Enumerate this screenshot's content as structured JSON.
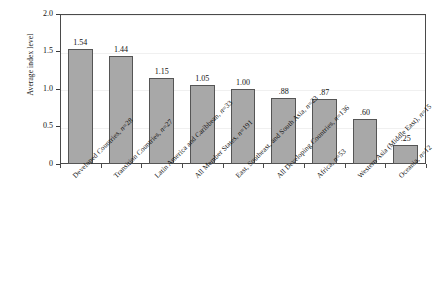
{
  "chart_data": {
    "type": "bar",
    "title": "",
    "xlabel": "",
    "ylabel": "Average index level",
    "ylim": [
      0,
      2.0
    ],
    "yticks": [
      "0",
      "0.5",
      "1.0",
      "1.5",
      "2.0"
    ],
    "ytick_values": [
      0,
      0.5,
      1.0,
      1.5,
      2.0
    ],
    "grid": true,
    "legend": "none",
    "categories": [
      "Developed Countries, n=28",
      "Transition Countries, n=27",
      "Latin America and Caribbean, n=33",
      "All Member States, n=191",
      "East, Southeast, and South Asia, n=23",
      "All Developing Countries, n=136",
      "Africa, n=53",
      "Western Asia (Middle East), n=15",
      "Oceania, n=12"
    ],
    "category_names": [
      "Developed Countries",
      "Transition Countries",
      "Latin America and Caribbean",
      "All Member States",
      "East, Southeast, and South Asia",
      "All Developing Countries",
      "Africa",
      "Western Asia (Middle East)",
      "Oceania"
    ],
    "sample_sizes": [
      28,
      27,
      33,
      191,
      23,
      136,
      53,
      15,
      12
    ],
    "values": [
      1.54,
      1.44,
      1.15,
      1.05,
      1.0,
      0.88,
      0.87,
      0.6,
      0.25
    ],
    "value_labels": [
      "1.54",
      "1.44",
      "1.15",
      "1.05",
      "1.00",
      ".88",
      ".87",
      ".60",
      ".25"
    ],
    "colors": {
      "bar_fill": "#a8a8a8",
      "bar_stroke": "#555555",
      "axis": "#4a4a4a",
      "grid": "#f0f0f0",
      "text": "#111111",
      "background": "#ffffff"
    }
  }
}
